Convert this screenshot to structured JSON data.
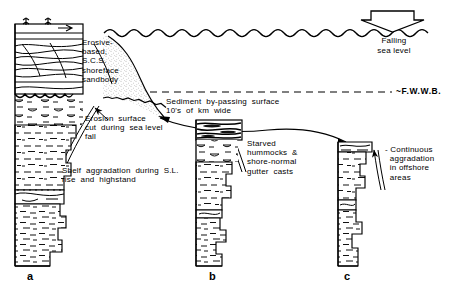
{
  "figure": {
    "type": "sedimentary-log-cross-section",
    "caption_labels": [
      "a",
      "b",
      "c"
    ]
  },
  "sea_level": {
    "arrow_name": "falling-sea-level-arrow",
    "label_line1": "Falling",
    "label_line2": "sea level"
  },
  "wave_base": {
    "label": "~F.W.W.B.",
    "line_style": "dashed"
  },
  "annotations": {
    "shoreface": "Erosive-\nbased,\nS.C.S.\nshoreface\nsandbody",
    "erosion_surface": "Erosion  surface\ncut  during  sea level\nfall",
    "shelf_aggradation": "Shelf  aggradation  during  S.L.\nrise  and  highstand",
    "bypass_surface": "Sediment  by-passing  surface\n10's  of  km  wide",
    "starved_hummocks": "Starved\nhummocks  &\nshore-normal\ngutter  casts",
    "offshore_aggradation": "- Continuous\n  aggradation\n  in offshore\n  areas"
  },
  "columns": [
    {
      "id": "a",
      "label": "a",
      "position": "proximal-shoreface",
      "units": [
        "rooted-top",
        "swaley-cross-stratified-sandstone",
        "erosional-scour-base",
        "lenticular-siltstone",
        "offshore-mudstone",
        "sharp-based-sandstone",
        "lower-mudstone"
      ]
    },
    {
      "id": "b",
      "label": "b",
      "position": "offshore-transition",
      "units": [
        "starved-hummocky-sandstone-beds",
        "lenticular-siltstone",
        "offshore-mudstone",
        "lower-mudstone"
      ]
    },
    {
      "id": "c",
      "label": "c",
      "position": "offshore",
      "units": [
        "thin-silty-beds",
        "offshore-mudstone"
      ]
    }
  ],
  "colors": {
    "ink": "#000000",
    "background": "#ffffff",
    "stipple": "#6f6f6f"
  }
}
